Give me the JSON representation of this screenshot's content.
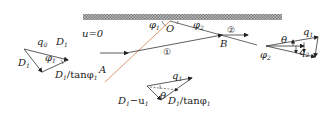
{
  "diagram": {
    "wall_label": "u=0",
    "points": {
      "O": "O",
      "A": "A",
      "B": "B"
    },
    "angles": {
      "phi1": "φ",
      "phi1_sub": "1",
      "phi2": "φ",
      "phi2_sub": "2"
    },
    "regions": {
      "r1": "①",
      "r2": "②"
    },
    "left_triangle": {
      "q0": "q",
      "q0_sub": "0",
      "D1_top": "D",
      "D1_top_sub": "1",
      "D1_left": "D",
      "D1_left_sub": "1",
      "phi1": "φ",
      "phi1_sub": "1",
      "bottom_label": "D",
      "bottom_label_sub": "1",
      "bottom_label_rest": "/tanφ",
      "bottom_label_rest_sub": "1"
    },
    "middle_triangle": {
      "q1": "q",
      "q1_sub": "1",
      "theta": "θ",
      "left_label": "D",
      "left_label_sub": "1",
      "left_label_rest": "−u",
      "left_label_rest_sub": "1",
      "right_label": "D",
      "right_label_sub": "1",
      "right_label_rest": "/tanφ",
      "right_label_rest_sub": "1"
    },
    "right_triangle": {
      "q1": "q",
      "q1_sub": "1",
      "theta": "θ",
      "phi2": "φ",
      "phi2_sub": "2",
      "q2": "q",
      "q2_sub": "2"
    },
    "colors": {
      "shock_line": "#d98a5a",
      "lines": "#333333",
      "wall": "#9a9a9a"
    }
  }
}
